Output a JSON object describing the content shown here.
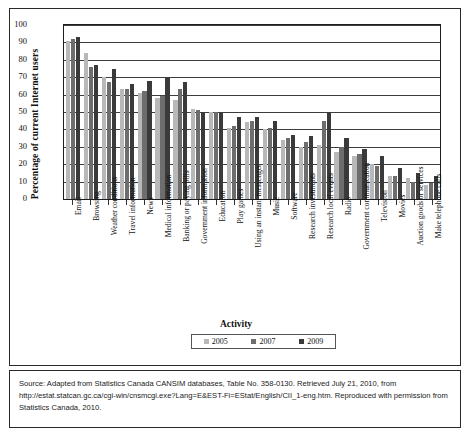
{
  "chart_data": {
    "type": "bar",
    "title": "",
    "xlabel": "Activity",
    "ylabel": "Percentage of current Internet users",
    "ylim": [
      0,
      100
    ],
    "ytick_labels": [
      "100",
      "90",
      "80",
      "70",
      "60",
      "50",
      "40",
      "30",
      "20",
      "10",
      "0"
    ],
    "grid": true,
    "legend_position": "bottom",
    "categories": [
      "Email",
      "Browsing",
      "Weather conditions",
      "Travel information",
      "News",
      "Medical information",
      "Banking or paying bills",
      "Government information",
      "Education",
      "Play games",
      "Using an instant messenger",
      "Music",
      "Software",
      "Research investments",
      "Research local events",
      "Radio",
      "Government communication",
      "Television",
      "Movies",
      "Auction goods or services",
      "Make telephone calls"
    ],
    "series": [
      {
        "name": "2005",
        "color": "#b8b8b8",
        "values": [
          91,
          84,
          70,
          63,
          61,
          58,
          57,
          52,
          50,
          41,
          44,
          40,
          34,
          30,
          31,
          27,
          25,
          20,
          13,
          12,
          8
        ]
      },
      {
        "name": "2007",
        "color": "#6d6d6d",
        "values": [
          92,
          76,
          67,
          63,
          62,
          59,
          63,
          51,
          50,
          42,
          45,
          41,
          35,
          33,
          45,
          30,
          26,
          19,
          13,
          10,
          9
        ]
      },
      {
        "name": "2009",
        "color": "#3a3a3a",
        "values": [
          93,
          77,
          75,
          66,
          68,
          70,
          67,
          50,
          50,
          47,
          47,
          45,
          37,
          36,
          50,
          35,
          29,
          25,
          18,
          15,
          13
        ]
      }
    ]
  },
  "legend": {
    "items": [
      {
        "label": "2005",
        "color": "#b8b8b8"
      },
      {
        "label": "2007",
        "color": "#6d6d6d"
      },
      {
        "label": "2009",
        "color": "#3a3a3a"
      }
    ]
  },
  "source": {
    "text": "Source: Adapted from Statistics Canada CANSIM databases, Table No. 358-0130. Retrieved July 21, 2010, from http://estat.statcan.gc.ca/cgi-win/cnsmcgi.exe?Lang=E&EST-Fi=EStat/English/CII_1-eng.htm. Reproduced with permission from Statistics Canada, 2010."
  }
}
